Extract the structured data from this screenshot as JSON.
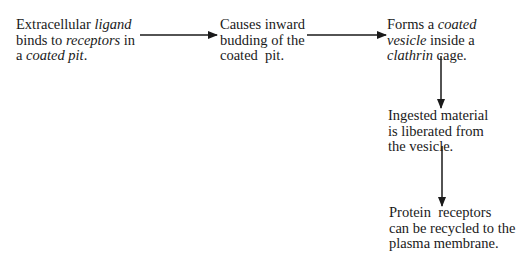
{
  "diagram": {
    "type": "flowchart",
    "nodes": [
      {
        "id": "step1",
        "lines": [
          [
            {
              "text": "Extracellular "
            },
            {
              "text": "ligand",
              "italic": true
            }
          ],
          [
            {
              "text": "binds to "
            },
            {
              "text": "receptors",
              "italic": true
            },
            {
              "text": " in"
            }
          ],
          [
            {
              "text": "a "
            },
            {
              "text": "coated pit",
              "italic": true
            },
            {
              "text": "."
            }
          ]
        ],
        "plain_text": "Extracellular ligand binds to receptors in a coated pit."
      },
      {
        "id": "step2",
        "lines": [
          [
            {
              "text": "Causes inward"
            }
          ],
          [
            {
              "text": "budding of the"
            }
          ],
          [
            {
              "text": "coated  pit."
            }
          ]
        ],
        "plain_text": "Causes inward budding of the coated pit."
      },
      {
        "id": "step3",
        "lines": [
          [
            {
              "text": "Forms a "
            },
            {
              "text": "coated",
              "italic": true
            }
          ],
          [
            {
              "text": "vesicle",
              "italic": true
            },
            {
              "text": " inside a"
            }
          ],
          [
            {
              "text": "clathrin",
              "italic": true
            },
            {
              "text": " cage."
            }
          ]
        ],
        "plain_text": "Forms a coated vesicle inside a clathrin cage."
      },
      {
        "id": "step4",
        "lines": [
          [
            {
              "text": "Ingested material"
            }
          ],
          [
            {
              "text": "is liberated from"
            }
          ],
          [
            {
              "text": "the vesicle."
            }
          ]
        ],
        "plain_text": "Ingested material is liberated from the vesicle."
      },
      {
        "id": "step5",
        "lines": [
          [
            {
              "text": "Protein  receptors"
            }
          ],
          [
            {
              "text": "can be recycled to the"
            }
          ],
          [
            {
              "text": "plasma membrane."
            }
          ]
        ],
        "plain_text": "Protein receptors can be recycled to the plasma membrane."
      }
    ],
    "edges": [
      {
        "from": "step1",
        "to": "step2",
        "direction": "right"
      },
      {
        "from": "step2",
        "to": "step3",
        "direction": "right"
      },
      {
        "from": "step3",
        "to": "step4",
        "direction": "down"
      },
      {
        "from": "step4",
        "to": "step5",
        "direction": "down"
      }
    ],
    "colors": {
      "text": "#1a1a1a",
      "arrow": "#1a1a1a",
      "background": "#ffffff"
    }
  }
}
